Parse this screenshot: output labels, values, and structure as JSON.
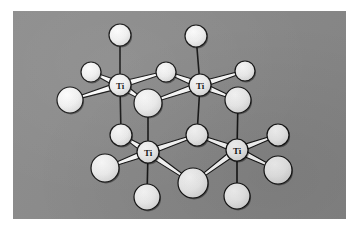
{
  "figure": {
    "kind": "crystal-structure-illustration",
    "caption": "",
    "plate": {
      "background_color": "#8a8a8a",
      "border_color": "#ffffff",
      "x": 13,
      "y": 11,
      "width": 333,
      "height": 208
    },
    "style": {
      "atom_fill": "#f2f2f2",
      "atom_highlight": "#ffffff",
      "atom_outline": "#111111",
      "bond_fill": "#ffffff",
      "bond_outline": "#111111",
      "label_color": "#111111"
    },
    "legend": {
      "metal_symbol": "Ti",
      "ligand_symbol": ""
    },
    "atoms": [
      {
        "id": "ti-top-left",
        "label": "Ti",
        "kind": "metal",
        "cx": 107,
        "cy": 74,
        "r": 11
      },
      {
        "id": "ti-top-right",
        "label": "Ti",
        "kind": "metal",
        "cx": 187,
        "cy": 74,
        "r": 11
      },
      {
        "id": "ti-bottom-left",
        "label": "Ti",
        "kind": "metal",
        "cx": 135,
        "cy": 141,
        "r": 11
      },
      {
        "id": "ti-bottom-right",
        "label": "Ti",
        "kind": "metal",
        "cx": 224,
        "cy": 139,
        "r": 11
      },
      {
        "id": "o-top-axial-left",
        "label": "",
        "kind": "ligand",
        "cx": 107,
        "cy": 24,
        "r": 11
      },
      {
        "id": "o-top-axial-right",
        "label": "",
        "kind": "ligand",
        "cx": 183,
        "cy": 25,
        "r": 11
      },
      {
        "id": "o-top-bridge",
        "label": "",
        "kind": "ligand",
        "cx": 153,
        "cy": 61,
        "r": 10
      },
      {
        "id": "o-upper-left-small",
        "label": "",
        "kind": "ligand",
        "cx": 78,
        "cy": 61,
        "r": 10
      },
      {
        "id": "o-upper-right-small",
        "label": "",
        "kind": "ligand",
        "cx": 232,
        "cy": 60,
        "r": 10
      },
      {
        "id": "o-far-left-large",
        "label": "",
        "kind": "ligand",
        "cx": 57,
        "cy": 89,
        "r": 13
      },
      {
        "id": "o-center-large",
        "label": "",
        "kind": "ligand",
        "cx": 135,
        "cy": 92,
        "r": 14
      },
      {
        "id": "o-right-large",
        "label": "",
        "kind": "ligand",
        "cx": 225,
        "cy": 89,
        "r": 13
      },
      {
        "id": "o-mid-left-small",
        "label": "",
        "kind": "ligand",
        "cx": 108,
        "cy": 124,
        "r": 11
      },
      {
        "id": "o-mid-bridge",
        "label": "",
        "kind": "ligand",
        "cx": 184,
        "cy": 124,
        "r": 11
      },
      {
        "id": "o-lower-left-large",
        "label": "",
        "kind": "ligand",
        "cx": 92,
        "cy": 157,
        "r": 14
      },
      {
        "id": "o-lower-center-big",
        "label": "",
        "kind": "ligand",
        "cx": 180,
        "cy": 172,
        "r": 15
      },
      {
        "id": "o-lower-right-small",
        "label": "",
        "kind": "ligand",
        "cx": 265,
        "cy": 124,
        "r": 11
      },
      {
        "id": "o-lower-right-large",
        "label": "",
        "kind": "ligand",
        "cx": 265,
        "cy": 159,
        "r": 14
      },
      {
        "id": "o-bottom-axial-left",
        "label": "",
        "kind": "ligand",
        "cx": 134,
        "cy": 186,
        "r": 13
      },
      {
        "id": "o-bottom-axial-right",
        "label": "",
        "kind": "ligand",
        "cx": 224,
        "cy": 185,
        "r": 13
      }
    ],
    "bonds": [
      {
        "from": "ti-top-left",
        "to": "o-top-axial-left",
        "style": "thin"
      },
      {
        "from": "ti-top-left",
        "to": "o-upper-left-small",
        "style": "thick"
      },
      {
        "from": "ti-top-left",
        "to": "o-far-left-large",
        "style": "thick"
      },
      {
        "from": "ti-top-left",
        "to": "o-top-bridge",
        "style": "thick"
      },
      {
        "from": "ti-top-left",
        "to": "o-center-large",
        "style": "thick"
      },
      {
        "from": "ti-top-left",
        "to": "o-mid-left-small",
        "style": "thin"
      },
      {
        "from": "ti-top-right",
        "to": "o-top-axial-right",
        "style": "thin"
      },
      {
        "from": "ti-top-right",
        "to": "o-top-bridge",
        "style": "thick"
      },
      {
        "from": "ti-top-right",
        "to": "o-upper-right-small",
        "style": "thick"
      },
      {
        "from": "ti-top-right",
        "to": "o-right-large",
        "style": "thick"
      },
      {
        "from": "ti-top-right",
        "to": "o-center-large",
        "style": "thick"
      },
      {
        "from": "ti-top-right",
        "to": "o-mid-bridge",
        "style": "thin"
      },
      {
        "from": "ti-bottom-left",
        "to": "o-mid-left-small",
        "style": "thick"
      },
      {
        "from": "ti-bottom-left",
        "to": "o-lower-left-large",
        "style": "thick"
      },
      {
        "from": "ti-bottom-left",
        "to": "o-center-large",
        "style": "thin"
      },
      {
        "from": "ti-bottom-left",
        "to": "o-mid-bridge",
        "style": "thick"
      },
      {
        "from": "ti-bottom-left",
        "to": "o-lower-center-big",
        "style": "thick"
      },
      {
        "from": "ti-bottom-left",
        "to": "o-bottom-axial-left",
        "style": "thin"
      },
      {
        "from": "ti-bottom-right",
        "to": "o-mid-bridge",
        "style": "thick"
      },
      {
        "from": "ti-bottom-right",
        "to": "o-lower-right-small",
        "style": "thick"
      },
      {
        "from": "ti-bottom-right",
        "to": "o-lower-right-large",
        "style": "thick"
      },
      {
        "from": "ti-bottom-right",
        "to": "o-lower-center-big",
        "style": "thick"
      },
      {
        "from": "ti-bottom-right",
        "to": "o-right-large",
        "style": "thin"
      },
      {
        "from": "ti-bottom-right",
        "to": "o-bottom-axial-right",
        "style": "thin"
      }
    ]
  }
}
